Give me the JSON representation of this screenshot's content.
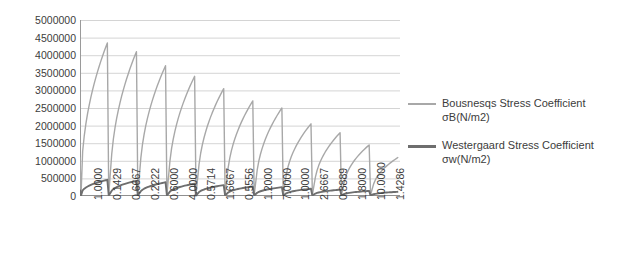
{
  "chart_data": {
    "type": "line",
    "title": "",
    "xlabel": "",
    "ylabel": "",
    "ylim": [
      0,
      5000000
    ],
    "ytick_values": [
      0,
      500000,
      1000000,
      1500000,
      2000000,
      2500000,
      3000000,
      3500000,
      4000000,
      4500000,
      5000000
    ],
    "ytick_labels": [
      "0",
      "500000",
      "1000000",
      "1500000",
      "2000000",
      "2500000",
      "3000000",
      "3500000",
      "4000000",
      "4500000",
      "5000000"
    ],
    "grid": true,
    "legend_position": "right",
    "categories": [
      "1.0000",
      "0.1429",
      "0.6667",
      "0.2222",
      "0.6000",
      "4.0000",
      "0.5714",
      "1.6667",
      "0.5556",
      "1.2000",
      "7.0000",
      "1.0000",
      "2.6667",
      "0.8889",
      "1.8000",
      "10.0000",
      "1.4286"
    ],
    "series": [
      {
        "name": "Bousnesqs Stress Coefficient σB(N/m2)",
        "color": "#a8a8a8",
        "peak_values": [
          4350000,
          4100000,
          3700000,
          3400000,
          3050000,
          2700000,
          2500000,
          2050000,
          1800000,
          1450000,
          1100000
        ],
        "start_value": 1100000,
        "trough_value": 30000,
        "shape": "sawtooth-decaying"
      },
      {
        "name": "Westergaard Stress Coefficient σw(N/m2)",
        "color": "#6e6e6e",
        "peak_values": [
          460000,
          430000,
          390000,
          350000,
          310000,
          270000,
          250000,
          205000,
          180000,
          145000,
          120000
        ],
        "start_value": 180000,
        "trough_value": 15000,
        "shape": "sawtooth-decaying"
      }
    ]
  },
  "legend": {
    "entries": [
      {
        "label": "Bousnesqs Stress Coefficient σB(N/m2)"
      },
      {
        "label": "Westergaard Stress Coefficient σw(N/m2)"
      }
    ]
  }
}
